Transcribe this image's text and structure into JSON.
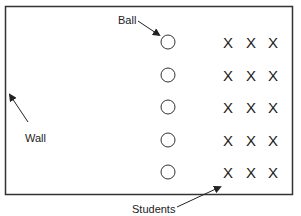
{
  "diagram": {
    "labels": {
      "ball": "Ball",
      "wall": "Wall",
      "students": "Students"
    },
    "ball_rows": 5,
    "student_columns": 3,
    "student_marker": "X",
    "rows": [
      {
        "students": [
          "X",
          "X",
          "X"
        ]
      },
      {
        "students": [
          "X",
          "X",
          "X"
        ]
      },
      {
        "students": [
          "X",
          "X",
          "X"
        ]
      },
      {
        "students": [
          "X",
          "X",
          "X"
        ]
      },
      {
        "students": [
          "X",
          "X",
          "X"
        ]
      }
    ],
    "colors": {
      "line": "#333333",
      "text": "#222222",
      "background": "#ffffff"
    }
  }
}
